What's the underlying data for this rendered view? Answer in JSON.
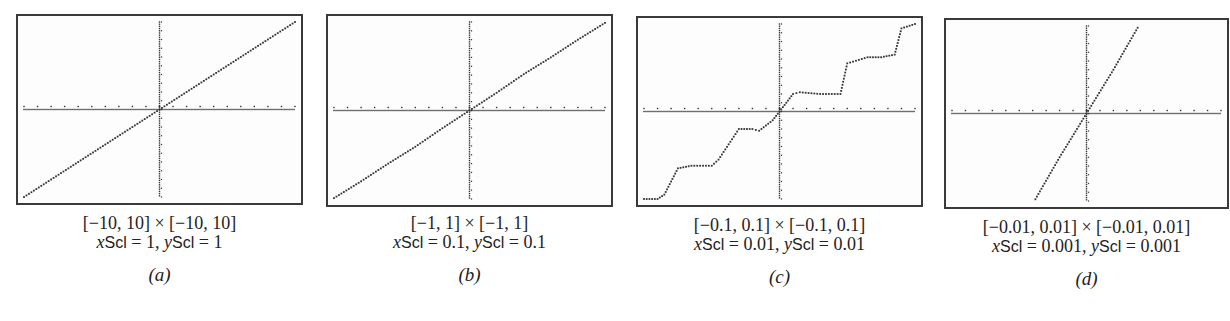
{
  "panels": [
    {
      "id": "a",
      "window": "[−10, 10] × [−10, 10]",
      "scl_x_value": "1",
      "scl_y_value": "1",
      "label": "(a)"
    },
    {
      "id": "b",
      "window": "[−1, 1] × [−1, 1]",
      "scl_x_value": "0.1",
      "scl_y_value": "0.1",
      "label": "(b)"
    },
    {
      "id": "c",
      "window": "[−0.1, 0.1] × [−0.1, 0.1]",
      "scl_x_value": "0.01",
      "scl_y_value": "0.01",
      "label": "(c)"
    },
    {
      "id": "d",
      "window": "[−0.01, 0.01] × [−0.01, 0.01]",
      "scl_x_value": "0.001",
      "scl_y_value": "0.001",
      "label": "(d)"
    }
  ],
  "scl_text": {
    "x_var": "x",
    "y_var": "y",
    "scl": "Scl",
    "eq": " = ",
    "sep": ", "
  },
  "colors": {
    "frame": "#3a3a3a",
    "dots": "#333333",
    "background": "#fdfdfd"
  },
  "chart_data": [
    {
      "type": "scatter",
      "title": "[−10, 10] × [−10, 10]  xScl = 1, yScl = 1  (a)",
      "xlim": [
        -10,
        10
      ],
      "ylim": [
        -10,
        10
      ],
      "xscl": 1,
      "yscl": 1,
      "grid": false,
      "legend": "none",
      "description": "Dotted calculator plot; curve appears as a straight line y = x through origin",
      "x": [
        -10,
        -8,
        -6,
        -4,
        -2,
        0,
        2,
        4,
        6,
        8,
        10
      ],
      "y": [
        -10,
        -8,
        -6,
        -4,
        -2,
        0,
        2,
        4,
        6,
        8,
        10
      ]
    },
    {
      "type": "scatter",
      "title": "[−1, 1] × [−1, 1]  xScl = 0.1, yScl = 0.1  (b)",
      "xlim": [
        -1,
        1
      ],
      "ylim": [
        -1,
        1
      ],
      "xscl": 0.1,
      "yscl": 0.1,
      "grid": false,
      "legend": "none",
      "description": "Nearly straight line y ≈ x with slight wobbles",
      "x": [
        -1,
        -0.8,
        -0.6,
        -0.4,
        -0.2,
        0,
        0.2,
        0.4,
        0.6,
        0.8,
        1
      ],
      "y": [
        -0.99,
        -0.8,
        -0.6,
        -0.41,
        -0.2,
        0,
        0.2,
        0.41,
        0.6,
        0.8,
        0.99
      ]
    },
    {
      "type": "line",
      "title": "[−0.1, 0.1] × [−0.1, 0.1]  xScl = 0.01, yScl = 0.01  (c)",
      "xlim": [
        -0.1,
        0.1
      ],
      "ylim": [
        -0.1,
        0.1
      ],
      "xscl": 0.01,
      "yscl": 0.01,
      "grid": false,
      "legend": "none",
      "description": "Staircase-like wavy curve through origin with plateaus",
      "x": [
        -0.1,
        -0.09,
        -0.085,
        -0.075,
        -0.065,
        -0.05,
        -0.045,
        -0.03,
        -0.02,
        -0.015,
        -0.005,
        0,
        0.005,
        0.01,
        0.015,
        0.03,
        0.045,
        0.05,
        0.065,
        0.075,
        0.085,
        0.09,
        0.1
      ],
      "y": [
        -0.1,
        -0.1,
        -0.095,
        -0.065,
        -0.062,
        -0.062,
        -0.055,
        -0.02,
        -0.02,
        -0.022,
        -0.01,
        0,
        0.01,
        0.02,
        0.022,
        0.02,
        0.02,
        0.055,
        0.062,
        0.062,
        0.065,
        0.095,
        0.1
      ]
    },
    {
      "type": "scatter",
      "title": "[−0.01, 0.01] × [−0.01, 0.01]  xScl = 0.001, yScl = 0.001  (d)",
      "xlim": [
        -0.01,
        0.01
      ],
      "ylim": [
        -0.01,
        0.01
      ],
      "xscl": 0.001,
      "yscl": 0.001,
      "grid": false,
      "legend": "none",
      "description": "Steep straight line through origin (slope about 2)",
      "x": [
        -0.0038,
        -0.002,
        0,
        0.002,
        0.0038
      ],
      "y": [
        -0.0098,
        -0.005,
        0,
        0.005,
        0.0098
      ]
    }
  ]
}
